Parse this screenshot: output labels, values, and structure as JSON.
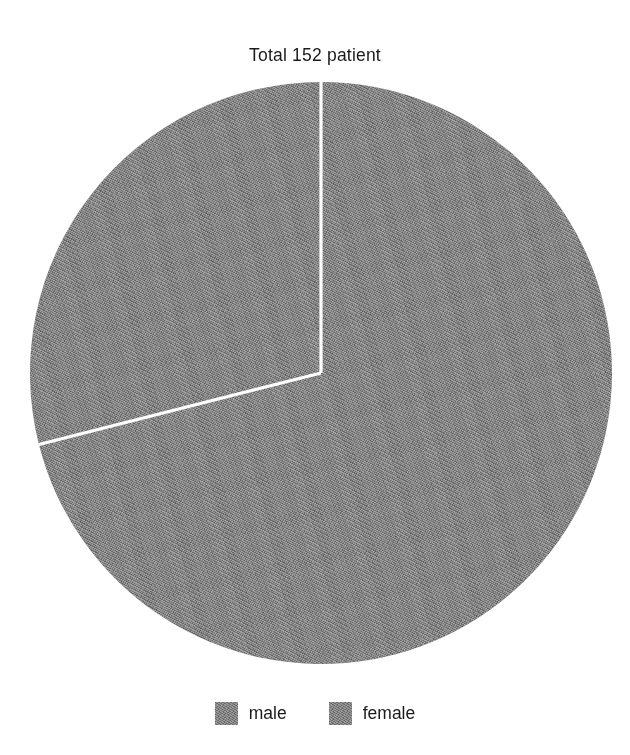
{
  "chart_data": {
    "type": "pie",
    "title": "Total 152 patient",
    "xlabel": "",
    "ylabel": "",
    "total": 152,
    "total_unit": "patient",
    "categories": [
      "male",
      "female"
    ],
    "values": [
      44,
      108
    ],
    "percentages": [
      28.9,
      71.1
    ],
    "angles_deg": [
      104,
      256
    ],
    "colors": [
      "#808080",
      "#808080"
    ],
    "start_angle_deg": 90,
    "direction": "counterclockwise",
    "slice_separator_color": "#ffffff",
    "grid": false,
    "legend_position": "bottom",
    "legend": [
      {
        "label": "male",
        "color": "#808080",
        "value": 44,
        "percent": 28.9
      },
      {
        "label": "female",
        "color": "#808080",
        "value": 108,
        "percent": 71.1
      }
    ]
  },
  "figure": {
    "background": "#ffffff",
    "text_color": "#1b1b1b"
  }
}
